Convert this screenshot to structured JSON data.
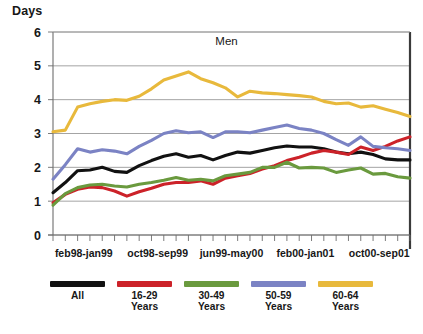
{
  "axis_unit_label": "Days",
  "legend": {
    "items": [
      {
        "label": "All",
        "color": "#111111"
      },
      {
        "label": "16-29\nYears",
        "color": "#CC2229"
      },
      {
        "label": "30-49\nYears",
        "color": "#6A9A3E"
      },
      {
        "label": "50-59\nYears",
        "color": "#7B83C4"
      },
      {
        "label": "60-64\nYears",
        "color": "#E8B93C"
      }
    ]
  },
  "chart_data": {
    "type": "line",
    "title": "Men",
    "xlabel": "",
    "ylabel": "Days",
    "ylim": [
      0,
      6
    ],
    "yticks": [
      0,
      1,
      2,
      3,
      4,
      5,
      6
    ],
    "ytick_labels": [
      "0",
      "1",
      "2",
      "3",
      "4",
      "5",
      "6"
    ],
    "grid": true,
    "legend_position": "bottom",
    "n_points": 30,
    "xtick_labels": [
      "feb98-jan99",
      "oct98-sep99",
      "jun99-may00",
      "feb00-jan01",
      "oct00-sep01"
    ],
    "xtick_positions": [
      2.5,
      8.5,
      14.5,
      20.5,
      26.5
    ],
    "series": [
      {
        "name": "All",
        "color": "#111111",
        "values": [
          1.25,
          1.55,
          1.9,
          1.92,
          2.0,
          1.88,
          1.85,
          2.05,
          2.2,
          2.33,
          2.4,
          2.3,
          2.35,
          2.22,
          2.35,
          2.45,
          2.42,
          2.5,
          2.58,
          2.63,
          2.6,
          2.6,
          2.55,
          2.45,
          2.4,
          2.45,
          2.38,
          2.25,
          2.22,
          2.22
        ]
      },
      {
        "name": "16-29 Years",
        "color": "#CC2229",
        "values": [
          0.95,
          1.2,
          1.35,
          1.42,
          1.4,
          1.3,
          1.15,
          1.28,
          1.38,
          1.5,
          1.55,
          1.55,
          1.6,
          1.5,
          1.68,
          1.75,
          1.82,
          1.95,
          2.05,
          2.2,
          2.3,
          2.42,
          2.5,
          2.45,
          2.38,
          2.6,
          2.5,
          2.62,
          2.78,
          2.9
        ]
      },
      {
        "name": "30-49 Years",
        "color": "#6A9A3E",
        "values": [
          0.88,
          1.22,
          1.4,
          1.48,
          1.5,
          1.45,
          1.42,
          1.5,
          1.55,
          1.62,
          1.7,
          1.62,
          1.65,
          1.6,
          1.75,
          1.8,
          1.85,
          2.0,
          2.0,
          2.15,
          1.98,
          2.0,
          1.98,
          1.85,
          1.92,
          1.98,
          1.8,
          1.82,
          1.72,
          1.68
        ]
      },
      {
        "name": "50-59 Years",
        "color": "#7B83C4",
        "values": [
          1.65,
          2.08,
          2.55,
          2.45,
          2.52,
          2.48,
          2.4,
          2.62,
          2.8,
          3.0,
          3.08,
          3.02,
          3.05,
          2.88,
          3.05,
          3.05,
          3.02,
          3.1,
          3.18,
          3.25,
          3.15,
          3.1,
          3.0,
          2.82,
          2.65,
          2.9,
          2.62,
          2.58,
          2.55,
          2.5
        ]
      },
      {
        "name": "60-64 Years",
        "color": "#E8B93C",
        "values": [
          3.05,
          3.1,
          3.78,
          3.88,
          3.95,
          4.0,
          3.98,
          4.1,
          4.32,
          4.58,
          4.7,
          4.82,
          4.62,
          4.5,
          4.35,
          4.08,
          4.25,
          4.2,
          4.18,
          4.15,
          4.12,
          4.08,
          3.95,
          3.88,
          3.9,
          3.78,
          3.82,
          3.72,
          3.62,
          3.5
        ]
      }
    ]
  }
}
